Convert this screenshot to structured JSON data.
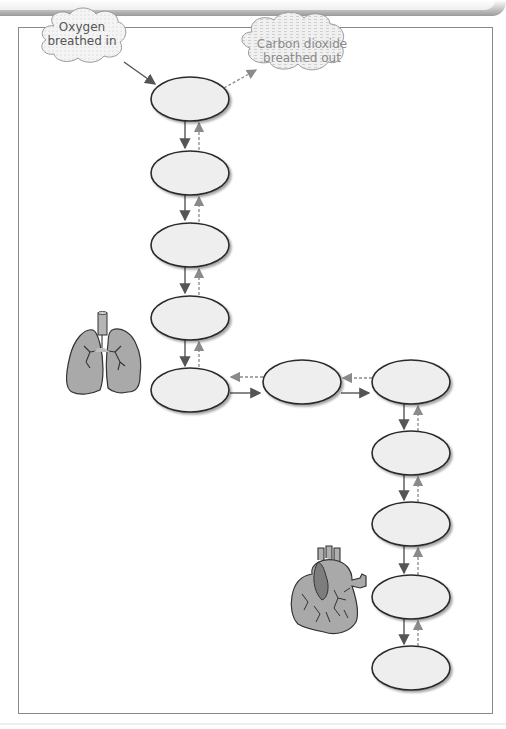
{
  "diagram": {
    "title": "",
    "clouds": {
      "in": {
        "line1": "Oxygen",
        "line2": "breathed in",
        "color": "#555555"
      },
      "out": {
        "line1": "Carbon dioxide",
        "line2": "breathed out",
        "color": "#8a8a8a"
      }
    },
    "nodes": [
      {
        "id": "n1",
        "label": "",
        "cx": 190,
        "cy": 99
      },
      {
        "id": "n2",
        "label": "",
        "cx": 190,
        "cy": 173
      },
      {
        "id": "n3",
        "label": "",
        "cx": 190,
        "cy": 245
      },
      {
        "id": "n4",
        "label": "",
        "cx": 190,
        "cy": 318
      },
      {
        "id": "n5",
        "label": "",
        "cx": 190,
        "cy": 390
      },
      {
        "id": "n6",
        "label": "",
        "cx": 302,
        "cy": 382
      },
      {
        "id": "n7",
        "label": "",
        "cx": 411,
        "cy": 382
      },
      {
        "id": "n8",
        "label": "",
        "cx": 411,
        "cy": 453
      },
      {
        "id": "n9",
        "label": "",
        "cx": 411,
        "cy": 524
      },
      {
        "id": "n10",
        "label": "",
        "cx": 411,
        "cy": 597
      },
      {
        "id": "n11",
        "label": "",
        "cx": 411,
        "cy": 668
      }
    ],
    "legend": {
      "solid_arrow": "oxygen path",
      "dashed_arrow": "carbon dioxide path"
    },
    "images": [
      "lungs",
      "heart"
    ],
    "colors": {
      "ellipse_fill": "#eeeeee",
      "ellipse_stroke": "#2a2a2a",
      "arrow_solid": "#555555",
      "arrow_dashed": "#8a8a8a",
      "organ_fill": "#a9a9a9",
      "frame_border": "#8a8a8a"
    }
  }
}
